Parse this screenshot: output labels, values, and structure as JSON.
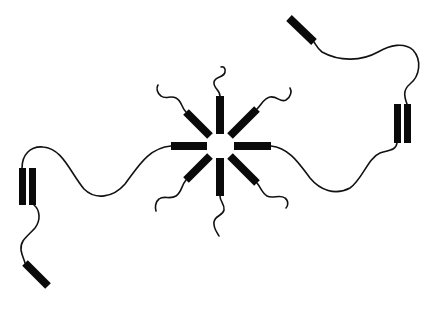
{
  "diagram": {
    "title": "",
    "colors": {
      "ink": "#0a0a0a",
      "background": "#ffffff"
    },
    "central_bundle": {
      "center": [
        220,
        146
      ],
      "helices": [
        {
          "name": "helix-north",
          "x1": 220,
          "y1": 134,
          "x2": 220,
          "y2": 96,
          "width": 8
        },
        {
          "name": "helix-northeast",
          "x1": 230,
          "y1": 136,
          "x2": 257,
          "y2": 109,
          "width": 8
        },
        {
          "name": "helix-east",
          "x1": 234,
          "y1": 146,
          "x2": 271,
          "y2": 146,
          "width": 8
        },
        {
          "name": "helix-southeast",
          "x1": 230,
          "y1": 156,
          "x2": 257,
          "y2": 183,
          "width": 8
        },
        {
          "name": "helix-south",
          "x1": 220,
          "y1": 158,
          "x2": 220,
          "y2": 196,
          "width": 8
        },
        {
          "name": "helix-southwest",
          "x1": 210,
          "y1": 156,
          "x2": 186,
          "y2": 180,
          "width": 8
        },
        {
          "name": "helix-west",
          "x1": 207,
          "y1": 146,
          "x2": 171,
          "y2": 146,
          "width": 8
        },
        {
          "name": "helix-northwest",
          "x1": 210,
          "y1": 136,
          "x2": 186,
          "y2": 112,
          "width": 8
        }
      ],
      "tails": [
        {
          "name": "tail-north",
          "d": "M220,96 C220,90 213,88 214,82 C215,76 224,78 225,72 C226,68 223,66 221,67"
        },
        {
          "name": "tail-northeast",
          "d": "M257,109 C262,104 264,98 270,97 C278,96 280,103 286,100 C291,97 292,91 290,88"
        },
        {
          "name": "tail-southeast",
          "d": "M257,183 C261,188 262,193 267,196 C273,199 280,194 285,198 C289,201 288,206 286,208"
        },
        {
          "name": "tail-south",
          "d": "M220,196 C220,202 225,204 224,210 C223,216 215,215 214,222 C213,228 217,232 219,236"
        },
        {
          "name": "tail-southwest",
          "d": "M186,180 C181,186 182,192 176,196 C170,200 164,195 159,199 C155,202 155,208 156,211"
        },
        {
          "name": "tail-northwest",
          "d": "M186,112 C181,107 182,101 176,98 C170,95 166,100 161,96 C157,93 156,88 158,85"
        }
      ]
    },
    "left_domain": {
      "helix_pair": [
        {
          "name": "left-helix-a",
          "x": 19,
          "y": 168,
          "w": 7,
          "h": 37
        },
        {
          "name": "left-helix-b",
          "x": 29,
          "y": 168,
          "w": 7,
          "h": 37
        }
      ],
      "terminal_helix": {
        "name": "left-terminal-helix",
        "x1": 25,
        "y1": 263,
        "x2": 48,
        "y2": 286,
        "width": 8
      },
      "loops": [
        {
          "name": "loop-left-to-center",
          "d": "M22,168 C22,155 30,146 43,147 C62,148 70,172 84,189 C95,200 113,198 125,184 C138,167 148,148 171,146"
        },
        {
          "name": "loop-left-to-terminal",
          "d": "M34,205 C40,210 41,220 35,228 C28,236 20,240 21,250 C22,256 24,259 25,263"
        }
      ]
    },
    "right_domain": {
      "helix_pair": [
        {
          "name": "right-helix-a",
          "x": 394,
          "y": 104,
          "w": 7,
          "h": 39
        },
        {
          "name": "right-helix-b",
          "x": 404,
          "y": 104,
          "w": 7,
          "h": 39
        }
      ],
      "terminal_helix": {
        "name": "right-terminal-helix",
        "x1": 289,
        "y1": 18,
        "x2": 314,
        "y2": 42,
        "width": 8
      },
      "loops": [
        {
          "name": "loop-center-to-right",
          "d": "M271,146 C290,148 300,165 310,178 C320,190 335,196 350,188 C362,180 368,158 380,153 C390,150 396,150 397,143"
        },
        {
          "name": "loop-right-to-terminal",
          "d": "M407,104 C404,96 403,90 410,84 C420,76 422,60 413,50 C404,42 390,45 378,52 C362,61 340,62 322,52 C318,49 316,45 314,42"
        }
      ]
    }
  }
}
